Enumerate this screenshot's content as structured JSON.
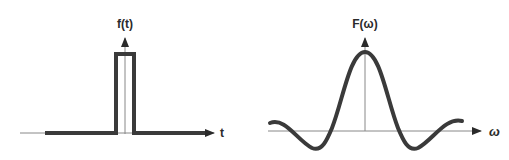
{
  "left_plot": {
    "title": "Rectangular pulse (time domain)",
    "y_label": "f(t)",
    "x_label": "t",
    "signal": "rect",
    "axis_color": "#888888",
    "curve_color": "#3a3a3a"
  },
  "right_plot": {
    "title": "Fourier transform (frequency domain)",
    "y_label": "F(ω)",
    "x_label": "ω",
    "signal": "sinc",
    "axis_color": "#888888",
    "curve_color": "#3a3a3a"
  }
}
